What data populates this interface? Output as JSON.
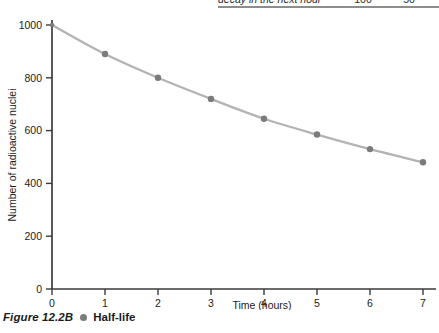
{
  "figure": {
    "number_label": "Figure 12.2B",
    "title": "Half-life",
    "legend_dot_icon": "filled-circle-icon"
  },
  "table_fragment": {
    "row_label": "decay in the next hour",
    "value_1": "100",
    "value_2": "50"
  },
  "chart_data": {
    "type": "line",
    "title": "",
    "xlabel": "Time (hours)",
    "ylabel": "Number of radioactive nuclei",
    "x": [
      0,
      1,
      2,
      3,
      4,
      5,
      6,
      7
    ],
    "values": [
      1000,
      890,
      800,
      720,
      645,
      585,
      530,
      480
    ],
    "series": [
      {
        "name": "Number of radioactive nuclei",
        "values": [
          1000,
          890,
          800,
          720,
          645,
          585,
          530,
          480
        ]
      }
    ],
    "xticks": [
      "0",
      "1",
      "2",
      "3",
      "4",
      "5",
      "6",
      "7"
    ],
    "yticks": [
      "0",
      "200",
      "400",
      "600",
      "800",
      "1000"
    ],
    "ytick_values": [
      0,
      200,
      400,
      600,
      800,
      1000
    ],
    "xlim": [
      0,
      7
    ],
    "ylim": [
      0,
      1000
    ],
    "grid": false,
    "legend": "none",
    "marker_color": "#7b7b7b",
    "line_color": "#b3b3b3",
    "axis_color": "#3b3b3b"
  }
}
